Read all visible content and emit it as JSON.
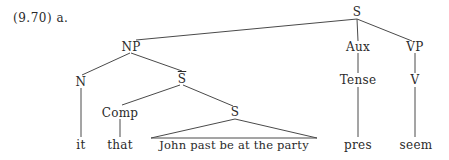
{
  "example": {
    "label": "(9.70) a."
  },
  "tree": {
    "root": "S",
    "nodes": {
      "S_top": "S",
      "NP": "NP",
      "Aux": "Aux",
      "VP": "VP",
      "N": "N",
      "Sbar": "S",
      "Comp": "Comp",
      "S_inner": "S",
      "Tense": "Tense",
      "V": "V"
    },
    "leaves": {
      "it": "it",
      "that": "that",
      "clause": "John past be at the party",
      "pres": "pres",
      "seem": "seem"
    },
    "structure": "[S [NP [N it] [S̄ [Comp that] [S John past be at the party]]] [Aux [Tense pres]] [VP [V seem]]]"
  }
}
